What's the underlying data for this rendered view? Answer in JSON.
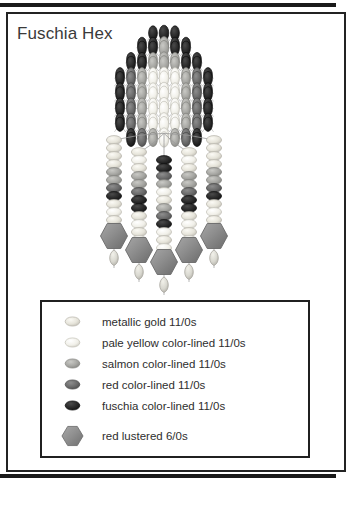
{
  "document": {
    "title": "Fuschia Hex",
    "background_color": "#ffffff",
    "frame_color": "#232323",
    "rule_color": "#1a1a1a"
  },
  "legend": {
    "border_color": "#202020",
    "items": [
      {
        "label": "metallic gold 11/0s",
        "swatch": "seed-bead-oval",
        "color": "#e8e6dd",
        "edge": "#b9b6ad",
        "size": "11/0"
      },
      {
        "label": "pale yellow color-lined 11/0s",
        "swatch": "seed-bead-oval",
        "color": "#efeee6",
        "edge": "#c4c2b8",
        "size": "11/0"
      },
      {
        "label": "salmon color-lined 11/0s",
        "swatch": "seed-bead-oval",
        "color": "#a8a8a4",
        "edge": "#8b8b87",
        "size": "11/0"
      },
      {
        "label": "red color-lined 11/0s",
        "swatch": "seed-bead-oval",
        "color": "#6e6e6e",
        "edge": "#4f4f4f",
        "size": "11/0"
      },
      {
        "label": "fuschia color-lined 11/0s",
        "swatch": "seed-bead-oval",
        "color": "#2b2b2b",
        "edge": "#151515",
        "size": "11/0"
      },
      {
        "label": "red lustered 6/0s",
        "swatch": "hex-bead",
        "color": "#8e8e8e",
        "edge": "#6d6d6d",
        "size": "6/0"
      }
    ]
  },
  "artwork": {
    "name": "beaded-amulet-pattern",
    "description": "Diamond-net beaded body with five fringe strands ending in hex beads and teardrop beads",
    "palette": {
      "metallic_gold": "#e8e6dd",
      "pale_yellow": "#efeee6",
      "salmon": "#a8a8a4",
      "red_lined": "#6e6e6e",
      "fuschia": "#2b2b2b",
      "hex_red_lustered": "#8e8e8e",
      "teardrop": "#d9d8d0",
      "thread": "#9a9a9a"
    },
    "body": {
      "center_x": 164,
      "top_y": 33,
      "columns": 9,
      "rows": 13
    },
    "fringe": {
      "strand_count": 5,
      "strands": [
        {
          "x": 114,
          "top": 140,
          "beads": [
            "metallic_gold",
            "metallic_gold",
            "metallic_gold",
            "metallic_gold",
            "salmon",
            "salmon",
            "red_lined",
            "fuschia",
            "metallic_gold",
            "pale_yellow",
            "metallic_gold",
            "pale_yellow",
            "metallic_gold"
          ],
          "hex_y": 236,
          "drop_y": 256
        },
        {
          "x": 139,
          "top": 152,
          "beads": [
            "metallic_gold",
            "pale_yellow",
            "metallic_gold",
            "salmon",
            "salmon",
            "red_lined",
            "fuschia",
            "fuschia",
            "metallic_gold",
            "pale_yellow",
            "metallic_gold",
            "pale_yellow",
            "metallic_gold"
          ],
          "hex_y": 250,
          "drop_y": 270
        },
        {
          "x": 164,
          "top": 160,
          "beads": [
            "fuschia",
            "fuschia",
            "red_lined",
            "salmon",
            "pale_yellow",
            "metallic_gold",
            "salmon",
            "red_lined",
            "fuschia",
            "pale_yellow",
            "metallic_gold",
            "pale_yellow",
            "metallic_gold",
            "pale_yellow"
          ],
          "hex_y": 262,
          "drop_y": 283
        },
        {
          "x": 189,
          "top": 152,
          "beads": [
            "metallic_gold",
            "pale_yellow",
            "metallic_gold",
            "salmon",
            "salmon",
            "red_lined",
            "fuschia",
            "fuschia",
            "metallic_gold",
            "pale_yellow",
            "metallic_gold",
            "pale_yellow",
            "metallic_gold"
          ],
          "hex_y": 250,
          "drop_y": 270
        },
        {
          "x": 214,
          "top": 140,
          "beads": [
            "metallic_gold",
            "metallic_gold",
            "metallic_gold",
            "metallic_gold",
            "salmon",
            "salmon",
            "red_lined",
            "fuschia",
            "metallic_gold",
            "pale_yellow",
            "metallic_gold",
            "pale_yellow",
            "metallic_gold"
          ],
          "hex_y": 236,
          "drop_y": 256
        }
      ]
    }
  }
}
